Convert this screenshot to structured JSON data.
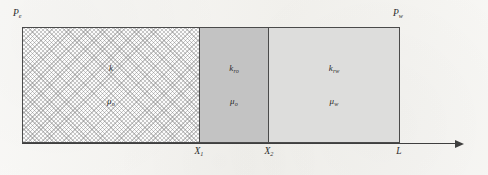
{
  "figure": {
    "background_color": "#f4f3ef",
    "line_color": "#4a4a4a"
  },
  "pressures": {
    "left": {
      "base": "P",
      "sub": "e"
    },
    "right": {
      "base": "P",
      "sub": "w"
    }
  },
  "regions": [
    {
      "id": "region-1",
      "fill_style": "crosshatch",
      "fill_color": "#fbfbfb",
      "permeability": {
        "base": "k",
        "sub": ""
      },
      "viscosity": {
        "base": "μ",
        "sub": "o"
      }
    },
    {
      "id": "region-2",
      "fill_style": "solid",
      "fill_color": "#c3c3c3",
      "permeability": {
        "base": "k",
        "sub": "ro"
      },
      "viscosity": {
        "base": "μ",
        "sub": "o"
      }
    },
    {
      "id": "region-3",
      "fill_style": "solid",
      "fill_color": "#dddddc",
      "permeability": {
        "base": "k",
        "sub": "rw"
      },
      "viscosity": {
        "base": "μ",
        "sub": "w"
      }
    }
  ],
  "axis": {
    "arrow": "right",
    "labels": [
      {
        "base": "X",
        "sub": "1"
      },
      {
        "base": "X",
        "sub": "2"
      },
      {
        "base": "L",
        "sub": ""
      }
    ]
  }
}
